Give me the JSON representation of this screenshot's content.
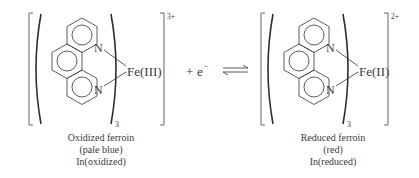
{
  "equation": {
    "left_species": {
      "metal_label": "Fe(III)",
      "nitrogen_top": "N",
      "nitrogen_bottom": "N",
      "ligand_count_subscript": "3",
      "charge": "3+",
      "caption": {
        "line1": "Oxidized ferroin",
        "line2": "(pale blue)",
        "line3": "In(oxidized)"
      }
    },
    "plus_electron": {
      "plus": "+",
      "electron": "e",
      "electron_charge": "−"
    },
    "arrow": "equilibrium-arrows",
    "right_species": {
      "metal_label": "Fe(II)",
      "nitrogen_top": "N",
      "nitrogen_bottom": "N",
      "ligand_count_subscript": "3",
      "charge": "2+",
      "caption": {
        "line1": "Reduced ferroin",
        "line2": "(red)",
        "line3": "In(reduced)"
      }
    }
  },
  "colors": {
    "ink": "#3a3a3a",
    "background": "#ffffff"
  }
}
